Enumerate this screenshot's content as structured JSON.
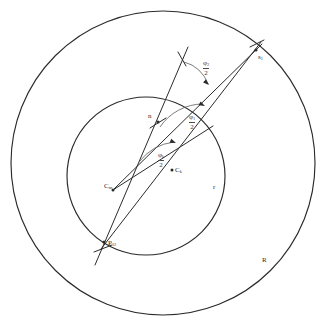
{
  "figure": {
    "background_color": "#ffffff",
    "stroke_color": "#2b2b2b",
    "text_color": "#2b2b2b"
  },
  "circles": [
    {
      "name": "outer-circle",
      "label": "R",
      "cx": 163,
      "cy": 163,
      "r": 152,
      "label_x": 262,
      "label_y": 257
    },
    {
      "name": "inner-circle",
      "label": "r",
      "cx": 146,
      "cy": 176,
      "r": 79,
      "label_x": 213,
      "label_y": 184
    }
  ],
  "points": [
    {
      "name": "center-point",
      "base": "C",
      "sub": "m",
      "x": 113,
      "y": 190,
      "label_x": 104,
      "label_y": 183
    },
    {
      "name": "ck-point",
      "base": "C",
      "sub": "k",
      "x": 172,
      "y": 170,
      "label_x": 175,
      "label_y": 167
    },
    {
      "name": "p12-point",
      "base": "P",
      "sub": "12",
      "x": 104,
      "y": 242,
      "label_x": 108,
      "label_y": 240
    },
    {
      "name": "s1-point",
      "base": "s",
      "sub": "1",
      "x": 256,
      "y": 50,
      "label_x": 258,
      "label_y": 54
    },
    {
      "name": "inner-intersection",
      "base": "n",
      "sub": "",
      "x": 158,
      "y": 122,
      "label_x": 148,
      "label_y": 113
    }
  ],
  "angles": [
    {
      "name": "angle-upper",
      "num": "φ",
      "num_sub": "2",
      "den": "2",
      "label_x": 203,
      "label_y": 60
    },
    {
      "name": "angle-middle",
      "num": "φ",
      "num_sub": "1",
      "den": "2",
      "label_x": 189,
      "label_y": 114
    },
    {
      "name": "angle-lower",
      "num": "φ",
      "num_sub": "k",
      "den": "2",
      "label_x": 158,
      "label_y": 152
    }
  ],
  "rays": [
    {
      "name": "ray-cm-to-s1",
      "x1": 113,
      "y1": 190,
      "x2": 262,
      "y2": 44
    },
    {
      "name": "ray-p12-to-s1",
      "x1": 101,
      "y1": 249,
      "x2": 261,
      "y2": 42
    },
    {
      "name": "ray-p12-upward",
      "x1": 95,
      "y1": 265,
      "x2": 188,
      "y2": 47
    },
    {
      "name": "ray-cm-to-mid",
      "x1": 113,
      "y1": 190,
      "x2": 213,
      "y2": 126
    }
  ],
  "arcs": [
    {
      "name": "arc-upper",
      "d": "M 184 62 A 34 34 0 0 1 208 84"
    },
    {
      "name": "arc-middle",
      "d": "M 160 127 A 52 52 0 0 1 203 104"
    },
    {
      "name": "arc-lower",
      "d": "M 139 162 A 52 52 0 0 1 174 142"
    }
  ],
  "tick_marks": [
    {
      "name": "tick-upper-left",
      "x1": 178,
      "y1": 52,
      "x2": 186,
      "y2": 66
    },
    {
      "name": "tick-p12-cross",
      "x1": 94,
      "y1": 252,
      "x2": 112,
      "y2": 245
    },
    {
      "name": "tick-s1-cross",
      "x1": 250,
      "y1": 47,
      "x2": 264,
      "y2": 40
    },
    {
      "name": "tick-inner-cross",
      "x1": 150,
      "y1": 128,
      "x2": 166,
      "y2": 118
    }
  ],
  "arrow_heads": [
    {
      "name": "arrowhead-upper",
      "x": 209,
      "y": 85,
      "angle": 42
    },
    {
      "name": "arrowhead-middle",
      "x": 205,
      "y": 106,
      "angle": 26
    },
    {
      "name": "arrowhead-lower",
      "x": 176,
      "y": 143,
      "angle": 22
    }
  ]
}
